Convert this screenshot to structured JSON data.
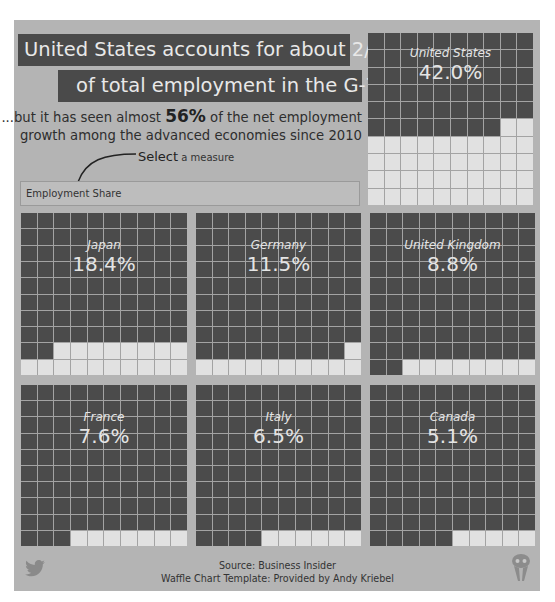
{
  "header": {
    "title_line1": "United States accounts for about 2/5th",
    "title_line2": "of total employment in the G-7...",
    "subtitle_pre": "...but it has seen almost ",
    "subtitle_bold": "56%",
    "subtitle_post": " of the net employment",
    "subtitle_line2": "growth among the advanced economies since 2010"
  },
  "selector": {
    "label_bold": "Select",
    "label_small": " a measure",
    "value": "Employment Share"
  },
  "colors": {
    "background": "#b4b4b4",
    "cell_empty": "#4b4b4b",
    "cell_filled": "#e1e1e1",
    "grid_line": "#a3a3a3",
    "title_box": "#4a4a4a"
  },
  "waffles": [
    {
      "country": "United States",
      "value_label": "42.0%",
      "cells": 42
    },
    {
      "country": "Japan",
      "value_label": "18.4%",
      "cells": 18
    },
    {
      "country": "Germany",
      "value_label": "11.5%",
      "cells": 11
    },
    {
      "country": "United Kingdom",
      "value_label": "8.8%",
      "cells": 8
    },
    {
      "country": "France",
      "value_label": "7.6%",
      "cells": 7
    },
    {
      "country": "Italy",
      "value_label": "6.5%",
      "cells": 6
    },
    {
      "country": "Canada",
      "value_label": "5.1%",
      "cells": 5
    }
  ],
  "footer": {
    "source": "Source: Business Insider",
    "credit": "Waffle Chart Template: Provided by Andy Kriebel"
  },
  "icons": {
    "twitter": "twitter-bird-icon",
    "logo": "author-logo-icon"
  },
  "chart_data": {
    "type": "waffle",
    "subtitle": "...but it has seen almost 56% of the net employment growth among the advanced economies since 2010",
    "measure": "Employment Share",
    "grid": "10x10",
    "categories": [
      "United States",
      "Japan",
      "Germany",
      "United Kingdom",
      "France",
      "Italy",
      "Canada"
    ],
    "values": [
      42.0,
      18.4,
      11.5,
      8.8,
      7.6,
      6.5,
      5.1
    ],
    "unit": "%",
    "source": "Business Insider"
  }
}
